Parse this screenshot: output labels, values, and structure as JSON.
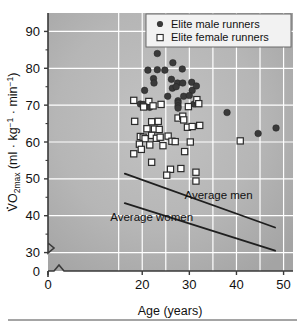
{
  "chart_data": {
    "type": "scatter",
    "title": "",
    "xlabel": "Age (years)",
    "ylabel": "VO2max (ml · kg-1 · min-1)",
    "ylabel_parts": {
      "v": "V",
      "o": "O",
      "sub": "2max",
      "open": " (ml · kg",
      "sup1": "−1",
      "mid": " · min",
      "sup2": "−1",
      "close": ")"
    },
    "xlim": [
      0,
      52
    ],
    "ylim": [
      25,
      95
    ],
    "x_ticks": [
      0,
      20,
      30,
      40,
      50
    ],
    "x_tick_labels": [
      "0",
      "20",
      "30",
      "40",
      "50"
    ],
    "y_ticks": [
      30,
      40,
      50,
      60,
      70,
      80,
      90
    ],
    "y_tick_labels": [
      "30",
      "40",
      "50",
      "60",
      "70",
      "80",
      "90"
    ],
    "y_zero_label": "0",
    "axis_break_x": true,
    "axis_break_y": true,
    "grid": true,
    "grid_color": "#ffffff",
    "plot_bg_color": "#b4b4b4",
    "legend_position": "top-right",
    "series": [
      {
        "name": "Elite male runners",
        "marker": "filled-circle",
        "color": "#3a3a3a",
        "points": [
          [
            23.2,
            84.0
          ],
          [
            26.5,
            81.5
          ],
          [
            21.2,
            79.5
          ],
          [
            23.2,
            79.6
          ],
          [
            24.8,
            79.5
          ],
          [
            28.5,
            79.8
          ],
          [
            22.4,
            77.2
          ],
          [
            26.2,
            77.0
          ],
          [
            22.5,
            76.0
          ],
          [
            27.5,
            76.0
          ],
          [
            28.6,
            76.0
          ],
          [
            30.5,
            76.2
          ],
          [
            20.5,
            74.0
          ],
          [
            26.4,
            74.6
          ],
          [
            27.2,
            75.0
          ],
          [
            30.6,
            74.0
          ],
          [
            31.5,
            75.2
          ],
          [
            25.4,
            72.4
          ],
          [
            28.8,
            72.4
          ],
          [
            30.0,
            72.6
          ],
          [
            19.6,
            70.3
          ],
          [
            20.2,
            70.2
          ],
          [
            27.6,
            71.2
          ],
          [
            27.6,
            70.6
          ],
          [
            27.6,
            69.8
          ],
          [
            27.6,
            69.2
          ],
          [
            31.0,
            70.3
          ],
          [
            31.8,
            70.6
          ],
          [
            21.6,
            69.4
          ],
          [
            38.0,
            68.0
          ],
          [
            44.6,
            62.3
          ],
          [
            48.4,
            63.8
          ]
        ]
      },
      {
        "name": "Elite female runners",
        "marker": "open-square",
        "color": "#ffffff",
        "edge_color": "#2b2b2b",
        "points": [
          [
            18.2,
            71.3
          ],
          [
            21.4,
            71.0
          ],
          [
            22.3,
            69.8
          ],
          [
            24.0,
            70.2
          ],
          [
            20.3,
            69.5
          ],
          [
            29.8,
            69.6
          ],
          [
            31.6,
            71.5
          ],
          [
            32.0,
            70.4
          ],
          [
            18.4,
            65.6
          ],
          [
            22.0,
            65.5
          ],
          [
            23.4,
            65.6
          ],
          [
            27.6,
            66.5
          ],
          [
            28.6,
            67.0
          ],
          [
            28.8,
            66.0
          ],
          [
            21.0,
            63.6
          ],
          [
            22.6,
            63.5
          ],
          [
            23.6,
            63.4
          ],
          [
            29.6,
            64.0
          ],
          [
            30.6,
            64.2
          ],
          [
            32.2,
            64.5
          ],
          [
            19.6,
            61.5
          ],
          [
            20.2,
            61.3
          ],
          [
            20.6,
            60.9
          ],
          [
            22.0,
            61.8
          ],
          [
            23.0,
            61.0
          ],
          [
            23.8,
            61.3
          ],
          [
            25.5,
            61.6
          ],
          [
            26.3,
            60.2
          ],
          [
            27.0,
            60.1
          ],
          [
            19.4,
            59.4
          ],
          [
            21.6,
            59.2
          ],
          [
            24.4,
            59.0
          ],
          [
            30.2,
            60.0
          ],
          [
            40.8,
            60.3
          ],
          [
            18.2,
            56.8
          ],
          [
            19.8,
            58.0
          ],
          [
            29.0,
            57.4
          ],
          [
            22.0,
            54.5
          ],
          [
            26.0,
            52.6
          ],
          [
            28.2,
            52.8
          ],
          [
            31.4,
            51.8
          ],
          [
            25.2,
            51.0
          ],
          [
            31.4,
            49.4
          ]
        ]
      }
    ],
    "trend_lines": [
      {
        "name": "Average men",
        "label": "Average men",
        "x": [
          16.3,
          48.2
        ],
        "y": [
          51.4,
          36.8
        ],
        "color": "#1f1f1f"
      },
      {
        "name": "Average women",
        "label": "Average women",
        "x": [
          16.3,
          48.2
        ],
        "y": [
          43.4,
          30.5
        ],
        "color": "#1f1f1f"
      }
    ],
    "annotations": [
      {
        "text": "Average men",
        "x": 36.2,
        "y": 44.4
      },
      {
        "text": "Average women",
        "x": 22.0,
        "y": 38.7
      }
    ]
  },
  "legend": {
    "items": [
      {
        "label": "Elite male runners",
        "marker": "filled-circle"
      },
      {
        "label": "Elite female runners",
        "marker": "open-square"
      }
    ]
  },
  "footer": {
    "rule": true
  }
}
